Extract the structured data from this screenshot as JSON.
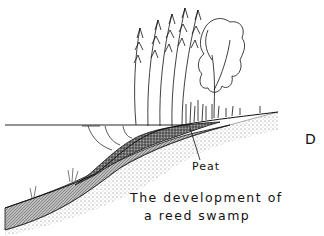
{
  "figure": {
    "panel_letter": "D",
    "labels": {
      "peat": "Peat"
    },
    "caption": {
      "line1": "The development of",
      "line2": "a reed swamp"
    },
    "elements": [
      "water-surface",
      "reeds",
      "tree",
      "peat-layer",
      "silt-layer",
      "sand-subsoil",
      "submerged-roots"
    ]
  }
}
